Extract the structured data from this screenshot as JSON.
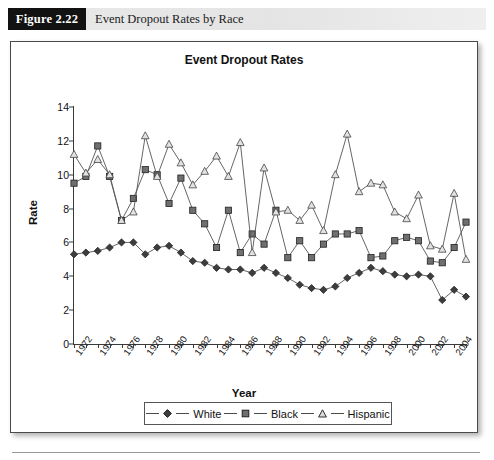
{
  "figure": {
    "tag": "Figure 2.22",
    "caption": "Event Dropout Rates by Race"
  },
  "chart_data": {
    "type": "line",
    "title": "Event Dropout Rates",
    "xlabel": "Year",
    "ylabel": "Rate",
    "ylim": [
      0,
      14
    ],
    "yticks": [
      0,
      2,
      4,
      6,
      8,
      10,
      12,
      14
    ],
    "xlim": [
      1972,
      2005
    ],
    "x": [
      1972,
      1973,
      1974,
      1975,
      1976,
      1977,
      1978,
      1979,
      1980,
      1981,
      1982,
      1983,
      1984,
      1985,
      1986,
      1987,
      1988,
      1989,
      1990,
      1991,
      1992,
      1993,
      1994,
      1995,
      1996,
      1997,
      1998,
      1999,
      2000,
      2001,
      2002,
      2003,
      2004,
      2005
    ],
    "xtick_labels": [
      "1972",
      "1974",
      "1976",
      "1978",
      "1980",
      "1982",
      "1984",
      "1986",
      "1988",
      "1990",
      "1992",
      "1994",
      "1996",
      "1998",
      "2000",
      "2002",
      "2004"
    ],
    "grid": false,
    "legend_position": "bottom",
    "series": [
      {
        "name": "White",
        "marker": "diamond-filled",
        "color": "#3d3d3d",
        "values": [
          5.3,
          5.4,
          5.5,
          5.7,
          6.0,
          6.0,
          5.3,
          5.7,
          5.8,
          5.4,
          4.9,
          4.8,
          4.5,
          4.4,
          4.4,
          4.2,
          4.5,
          4.2,
          3.9,
          3.5,
          3.3,
          3.2,
          3.4,
          3.9,
          4.2,
          4.5,
          4.3,
          4.1,
          4.0,
          4.1,
          4.0,
          2.6,
          3.2,
          2.8
        ]
      },
      {
        "name": "Black",
        "marker": "square-filled",
        "color": "#6f6f6f",
        "values": [
          9.5,
          9.9,
          11.7,
          9.9,
          7.3,
          8.6,
          10.3,
          10.0,
          8.3,
          9.8,
          7.9,
          7.1,
          5.7,
          7.9,
          5.4,
          6.5,
          5.9,
          7.9,
          5.1,
          6.1,
          5.1,
          5.9,
          6.5,
          6.5,
          6.7,
          5.1,
          5.2,
          6.1,
          6.3,
          6.1,
          4.9,
          4.8,
          5.7,
          7.2
        ]
      },
      {
        "name": "Hispanic",
        "marker": "triangle-open",
        "color": "#8a8a8a",
        "values": [
          11.2,
          10.1,
          10.9,
          10.0,
          7.3,
          7.8,
          12.3,
          9.9,
          11.8,
          10.7,
          9.4,
          10.2,
          11.1,
          9.9,
          11.9,
          5.4,
          10.4,
          7.8,
          7.9,
          7.3,
          8.2,
          6.7,
          10.0,
          12.4,
          9.0,
          9.5,
          9.4,
          7.8,
          7.4,
          8.8,
          5.8,
          5.6,
          8.9,
          5.0
        ]
      }
    ]
  },
  "legend": {
    "items": [
      {
        "label": "White"
      },
      {
        "label": "Black"
      },
      {
        "label": "Hispanic"
      }
    ]
  }
}
